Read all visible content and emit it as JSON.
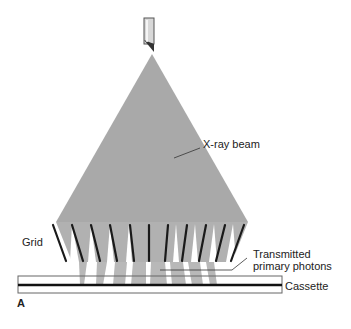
{
  "figure": {
    "panel_label": "A",
    "labels": {
      "beam": "X-ray beam",
      "grid": "Grid",
      "transmitted_line1": "Transmitted",
      "transmitted_line2": "primary photons",
      "cassette": "Cassette"
    },
    "colors": {
      "beam": "#a9a9a9",
      "slat": "#1a1a1a",
      "photons": "#b8b8b8",
      "outline": "#555555"
    },
    "components": [
      "x-ray tube",
      "x-ray beam",
      "grid",
      "transmitted primary photons",
      "cassette"
    ],
    "grid_slat_count": 10
  }
}
